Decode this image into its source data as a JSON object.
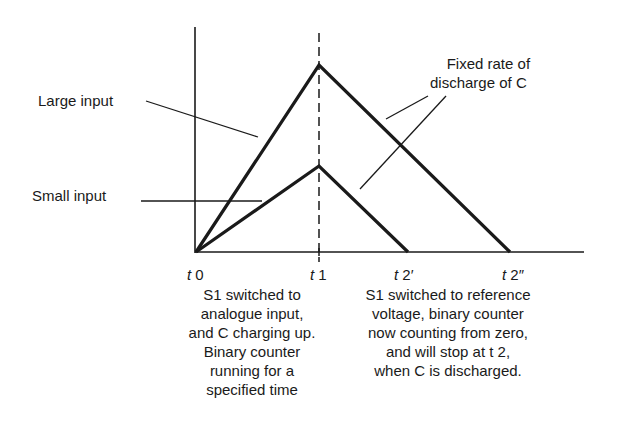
{
  "diagram": {
    "type": "dual-slope integration timing diagram",
    "labels": {
      "large_input": "Large input",
      "small_input": "Small input",
      "discharge_line1": "Fixed rate of",
      "discharge_line2": "discharge of C"
    },
    "ticks": {
      "t0": {
        "italic": "t",
        "rest": "0"
      },
      "t1": {
        "italic": "t",
        "rest": "1"
      },
      "t2_small": {
        "italic": "t",
        "rest": "2′"
      },
      "t2_large": {
        "italic": "t",
        "rest": "2″"
      }
    },
    "captions": {
      "left": [
        "S1 switched to",
        "analogue input,",
        "and C charging up.",
        "Binary counter",
        "running for a",
        "specified time"
      ],
      "right": [
        "S1 switched to reference",
        "voltage, binary counter",
        "now counting from zero,",
        "and will stop at t 2,",
        "when C is discharged."
      ]
    },
    "curves": {
      "large_input": {
        "t0": 0,
        "peak_time": "t1",
        "peak_level": 1.0,
        "end_time": "t2″"
      },
      "small_input": {
        "t0": 0,
        "peak_time": "t1",
        "peak_level": 0.47,
        "end_time": "t2′"
      }
    },
    "colors": {
      "ink": "#1a1a1a",
      "background": "#ffffff"
    }
  }
}
